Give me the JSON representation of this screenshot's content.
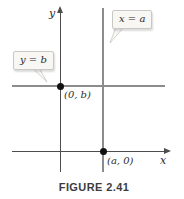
{
  "figure": {
    "caption": "FIGURE 2.41",
    "axes": {
      "x_label": "x",
      "y_label": "y"
    },
    "lines": [
      {
        "equation": "x = a",
        "orientation": "vertical"
      },
      {
        "equation": "y = b",
        "orientation": "horizontal"
      }
    ],
    "points": [
      {
        "label": "(0, b)",
        "location": "y-axis intersection with y = b"
      },
      {
        "label": "(a, 0)",
        "location": "x-axis intersection with x = a"
      }
    ],
    "colors": {
      "axis": "#4d4d4d",
      "const_line": "#8c8c8c",
      "point": "#111111",
      "callout_bg": "#f8f7f3",
      "callout_border": "#c9c9c3",
      "text": "#2b2b2b",
      "caption": "#3d3d3d",
      "background": "#ffffff"
    }
  }
}
